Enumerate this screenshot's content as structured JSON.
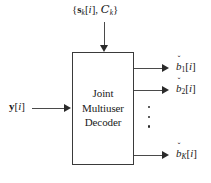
{
  "diagram": {
    "type": "block-diagram",
    "background_color": "#ffffff",
    "line_color": "#4a4a4a",
    "text_color": "#1a1a1a"
  },
  "block": {
    "line1": "Joint",
    "line2": "Multiuser",
    "line3": "Decoder"
  },
  "inputs": {
    "top": {
      "open_brace": "{",
      "s_symbol": "s",
      "s_subscript": "k",
      "bracket_open": "[",
      "index": "i",
      "bracket_close": "]",
      "comma": ", ",
      "c_symbol": "C",
      "c_subscript": "k",
      "close_brace": "}",
      "plain_text": "{s_k[i], C_k}"
    },
    "left": {
      "symbol": "y",
      "bracket_open": "[",
      "index": "i",
      "bracket_close": "]",
      "plain_text": "y[i]"
    }
  },
  "outputs": [
    {
      "symbol": "b",
      "subscript": "1",
      "bracket_open": "[",
      "index": "i",
      "bracket_close": "]",
      "plain_text": "b̌1[i]"
    },
    {
      "symbol": "b",
      "subscript": "2",
      "bracket_open": "[",
      "index": "i",
      "bracket_close": "]",
      "plain_text": "b̌2[i]"
    },
    {
      "symbol": "b",
      "subscript": "K",
      "bracket_open": "[",
      "index": "i",
      "bracket_close": "]",
      "plain_text": "b̌K[i]"
    }
  ],
  "ellipsis": {
    "symbol": "⋮",
    "dot_count": 3
  }
}
